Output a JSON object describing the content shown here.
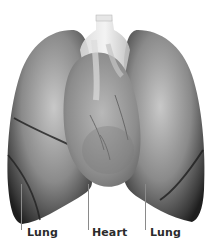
{
  "figure": {
    "title": "",
    "colors": {
      "background": "#ffffff",
      "lung_dark": "#2a2a2a",
      "lung_mid": "#7d7d7d",
      "lung_light": "#c9c9c9",
      "heart": "#9a9a9a",
      "label_text": "#2b2b2b",
      "leader_line": "#8a8a8a"
    },
    "labels": [
      {
        "id": "left-lung",
        "text": "Lung"
      },
      {
        "id": "heart",
        "text": "Heart"
      },
      {
        "id": "right-lung",
        "text": "Lung"
      }
    ]
  }
}
